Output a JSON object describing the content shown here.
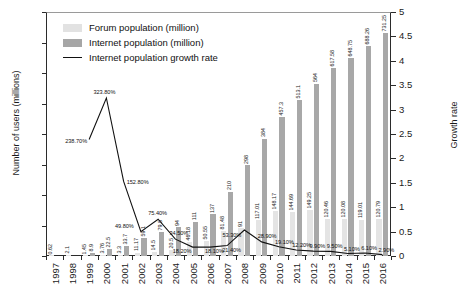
{
  "chart_data": {
    "type": "bar",
    "title": "",
    "xlabel": "",
    "ylabel": "Number of users (millions)",
    "y2label": "Growth rate",
    "ylim": [
      0,
      800
    ],
    "y2lim": [
      0,
      5
    ],
    "yticks": [
      "0",
      "100",
      "200",
      "300",
      "400",
      "500",
      "600",
      "700",
      "800"
    ],
    "y2ticks": [
      "0",
      "0.5",
      "1",
      "1.5",
      "2",
      "2.5",
      "3",
      "3.5",
      "4",
      "4.5",
      "5"
    ],
    "grid": false,
    "legend_position": "top-left",
    "legend": [
      {
        "key": "forum",
        "label": "Forum population (million)",
        "color": "#e4e4e4",
        "kind": "bar"
      },
      {
        "key": "internet",
        "label": "Internet population (million)",
        "color": "#a8a8a8",
        "kind": "bar"
      },
      {
        "key": "rate",
        "label": "Internet population growth rate",
        "color": "#111111",
        "kind": "line"
      }
    ],
    "categories": [
      "1997",
      "1998",
      "1999",
      "2000",
      "2001",
      "2002",
      "2003",
      "2004",
      "2005",
      "2006",
      "2007",
      "2008",
      "2009",
      "2010",
      "2011",
      "2012",
      "2013",
      "2014",
      "2015",
      "2016"
    ],
    "series": [
      {
        "name": "Forum population (million)",
        "axis": "left",
        "values": [
          0.62,
          2.1,
          1.45,
          3.76,
          3.3,
          11.17,
          14.5,
          20.5,
          46.18,
          50.55,
          81.48,
          91,
          117.01,
          148.17,
          144.69,
          149.25,
          120.46,
          120.08,
          119.01,
          120.79
        ],
        "labels": [
          "0.62",
          "2.1",
          "1.45",
          "3.76",
          "3.3",
          "11.17",
          "14.5",
          "20.5",
          "46.18",
          "50.55",
          "81.48",
          "91",
          "117.01",
          "148.17",
          "144.69",
          "149.25",
          "120.46",
          "120.08",
          "119.01",
          "120.79"
        ]
      },
      {
        "name": "Internet population (million)",
        "axis": "left",
        "values": [
          null,
          null,
          8.9,
          22.5,
          33.7,
          59.1,
          79.5,
          94,
          111,
          137,
          210,
          298,
          384,
          457.3,
          513.1,
          564,
          617.58,
          648.75,
          688.26,
          731.25
        ],
        "labels": [
          "",
          "",
          "8.9",
          "22.5",
          "33.7",
          "59.1",
          "79.5",
          "94",
          "111",
          "137",
          "210",
          "298",
          "384",
          "457.3",
          "513.1",
          "564",
          "617.58",
          "648.75",
          "688.26",
          "731.25"
        ]
      },
      {
        "name": "Internet population growth rate",
        "axis": "right",
        "values": [
          null,
          null,
          2.387,
          3.238,
          1.528,
          0.498,
          0.754,
          0.345,
          0.1828,
          0.181,
          0.214,
          0.533,
          0.289,
          0.191,
          0.122,
          0.099,
          0.095,
          0.051,
          0.061,
          0.029
        ],
        "labels": [
          "",
          "",
          "238.70%",
          "323.80%",
          "152.80%",
          "49.80%",
          "75.40%",
          "34.50%",
          "18.20%",
          "18.10%",
          "21.40%",
          "53.30%",
          "28.90%",
          "19.10%",
          "12.20%",
          "9.90%",
          "9.50%",
          "5.10%",
          "6.10%",
          "2.90%"
        ]
      }
    ]
  }
}
